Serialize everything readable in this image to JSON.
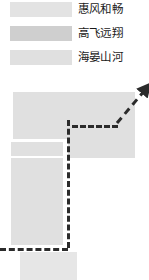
{
  "legend": {
    "items": [
      {
        "label": "惠风和畅",
        "color": "#e3e3e3",
        "swatch_name": "legend-swatch-huifenghechang"
      },
      {
        "label": "高飞远翔",
        "color": "#cfcfcf",
        "swatch_name": "legend-swatch-gaofeiyuanxiang"
      },
      {
        "label": "海晏山河",
        "color": "#e0e0e0",
        "swatch_name": "legend-swatch-haiyanshanhe"
      }
    ]
  },
  "diagram": {
    "bars": [
      {
        "name": "bar-top-wide",
        "color": "#e0e0e0",
        "x": 13,
        "y": 92,
        "w": 122,
        "h": 47
      },
      {
        "name": "bar-mid-left",
        "color": "#e0e0e0",
        "x": 11,
        "y": 142,
        "w": 52,
        "h": 14
      },
      {
        "name": "bar-mid-right",
        "color": "#e0e0e0",
        "x": 68,
        "y": 139,
        "w": 67,
        "h": 19
      },
      {
        "name": "bar-tall-left",
        "color": "#e0e0e0",
        "x": 11,
        "y": 158,
        "w": 52,
        "h": 87
      },
      {
        "name": "bar-bottom-left",
        "color": "#e6e6e6",
        "x": 20,
        "y": 252,
        "w": 57,
        "h": 28
      }
    ],
    "dashes": [
      {
        "name": "dash-horizontal-upper",
        "orientation": "horizontal",
        "x": 72,
        "y": 125,
        "length": 46
      },
      {
        "name": "dash-vertical-main",
        "orientation": "vertical",
        "x": 67,
        "y": 120,
        "length": 128
      },
      {
        "name": "dash-horizontal-lower",
        "orientation": "horizontal",
        "x": 0,
        "y": 248,
        "length": 68
      }
    ],
    "arrow": {
      "name": "trend-arrow",
      "color": "#2b2b2b",
      "x1": 117,
      "y1": 123,
      "x2": 145,
      "y2": 90
    }
  }
}
